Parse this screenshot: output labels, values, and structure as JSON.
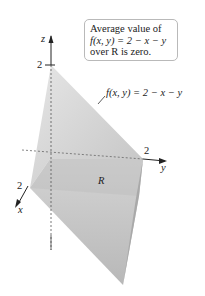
{
  "callout": {
    "line1": "Average value of",
    "line2": "f(x, y) = 2 − x − y",
    "line3": "over R is zero."
  },
  "surface_label": "f(x, y) = 2 − x − y",
  "axes": {
    "z_label": "z",
    "y_label": "y",
    "x_label": "x",
    "z_tick": "2",
    "y_tick": "2",
    "x_tick": "2"
  },
  "region_label": "R",
  "colors": {
    "surface_light": "#e4e4e4",
    "surface_mid": "#cfcfcf",
    "surface_dark": "#b2b2b2",
    "axis": "#222222",
    "callout_border": "#b9b9b9"
  }
}
